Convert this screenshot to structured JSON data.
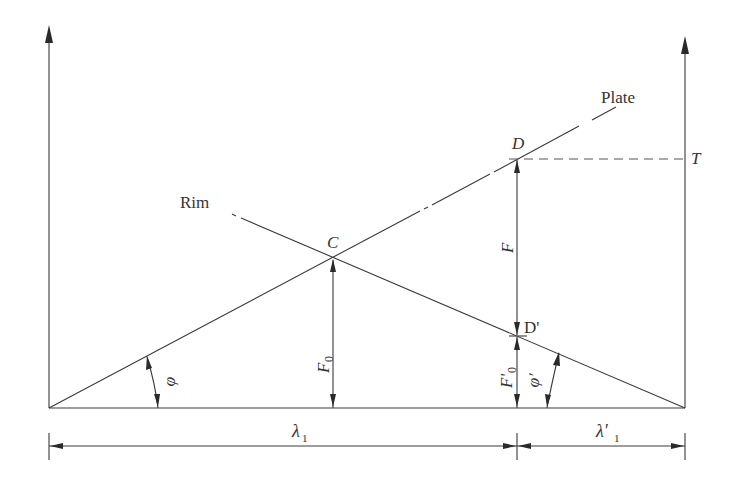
{
  "diagram": {
    "type": "force-displacement geometry",
    "labels": {
      "plate": "Plate",
      "rim": "Rim",
      "point_c": "C",
      "point_d": "D",
      "point_d_prime": "D'",
      "point_t": "T",
      "force_f": "F",
      "force_f0": "F",
      "force_f0_sub": "0",
      "force_f0_prime": "F'",
      "force_f0_prime_sub": "0",
      "angle_phi": "φ",
      "angle_phi_prime": "φ'",
      "lambda1": "λ",
      "lambda1_sub": "1",
      "lambda1_prime": "λ'",
      "lambda1_prime_sub": "1"
    },
    "colors": {
      "line": "#3a3a3a",
      "text": "#333333",
      "background": "#ffffff"
    }
  }
}
